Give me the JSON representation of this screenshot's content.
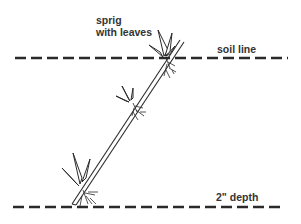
{
  "diagram": {
    "labels": {
      "sprig_line1": "sprig",
      "sprig_line2": "with leaves",
      "soil_line": "soil line",
      "depth": "2\" depth"
    },
    "elements": {
      "soil_line_y": 58,
      "depth_line_y": 207,
      "stem": {
        "from": [
          74,
          203
        ],
        "to": [
          182,
          40
        ]
      },
      "leaf_nodes": [
        {
          "name": "top",
          "x": 166,
          "y": 58
        },
        {
          "name": "middle",
          "x": 133,
          "y": 103
        },
        {
          "name": "bottom",
          "x": 83,
          "y": 186
        }
      ]
    },
    "colors": {
      "ink": "#2a2a2a",
      "background": "#ffffff"
    }
  }
}
